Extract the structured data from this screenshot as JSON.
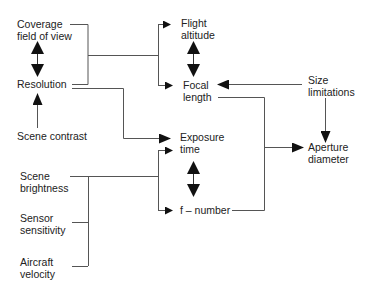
{
  "diagram": {
    "type": "flow",
    "nodes": {
      "coverage": {
        "line1": "Coverage",
        "line2": "field of view"
      },
      "resolution": {
        "line1": "Resolution"
      },
      "scene_contrast": {
        "line1": "Scene contrast"
      },
      "flight_altitude": {
        "line1": "Flight",
        "line2": "altitude"
      },
      "focal_length": {
        "line1": "Focal",
        "line2": "length"
      },
      "size_limitations": {
        "line1": "Size",
        "line2": "limitations"
      },
      "exposure_time": {
        "line1": "Exposure",
        "line2": "time"
      },
      "f_number": {
        "line1": "f – number"
      },
      "aperture_diameter": {
        "line1": "Aperture",
        "line2": "diameter"
      },
      "scene_brightness": {
        "line1": "Scene",
        "line2": "brightness"
      },
      "sensor_sensitivity": {
        "line1": "Sensor",
        "line2": "sensitivity"
      },
      "aircraft_velocity": {
        "line1": "Aircraft",
        "line2": "velocity"
      }
    },
    "edges": [
      {
        "from": "coverage",
        "to": "flight_altitude"
      },
      {
        "from": "coverage",
        "to": "focal_length"
      },
      {
        "from": "resolution",
        "to": "flight_altitude"
      },
      {
        "from": "resolution",
        "to": "focal_length"
      },
      {
        "from": "resolution",
        "to": "exposure_time"
      },
      {
        "from": "scene_contrast",
        "to": "resolution"
      },
      {
        "from": "coverage",
        "to": "resolution",
        "bidirectional": true
      },
      {
        "from": "flight_altitude",
        "to": "focal_length",
        "bidirectional": true
      },
      {
        "from": "size_limitations",
        "to": "focal_length"
      },
      {
        "from": "size_limitations",
        "to": "aperture_diameter"
      },
      {
        "from": "focal_length",
        "to": "aperture_diameter"
      },
      {
        "from": "f_number",
        "to": "aperture_diameter"
      },
      {
        "from": "exposure_time",
        "to": "f_number",
        "bidirectional": true
      },
      {
        "from": "scene_brightness",
        "to": "exposure_time"
      },
      {
        "from": "scene_brightness",
        "to": "f_number"
      },
      {
        "from": "sensor_sensitivity",
        "to": "exposure_time"
      },
      {
        "from": "sensor_sensitivity",
        "to": "f_number"
      },
      {
        "from": "aircraft_velocity",
        "to": "exposure_time"
      },
      {
        "from": "aircraft_velocity",
        "to": "f_number"
      }
    ],
    "colors": {
      "line": "#444444",
      "text": "#222222",
      "background": "#ffffff"
    }
  }
}
